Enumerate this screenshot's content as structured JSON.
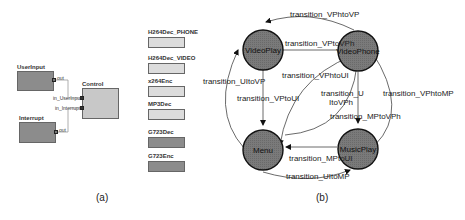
{
  "panel_a": {
    "caption": "(a)",
    "blocks": {
      "userinput": {
        "label": "UserInput",
        "port": "out"
      },
      "interrupt": {
        "label": "Interrupt",
        "port": "out"
      },
      "control": {
        "label": "Control",
        "ports": [
          "in_UserInput",
          "in_Interrupt"
        ]
      }
    },
    "component_list": [
      {
        "label": "H264Dec_PHONE",
        "shade": "light"
      },
      {
        "label": "H264Dec_VIDEO",
        "shade": "light"
      },
      {
        "label": "x264Enc",
        "shade": "light"
      },
      {
        "label": "MP3Dec",
        "shade": "light"
      },
      {
        "label": "G723Dec",
        "shade": "dark"
      },
      {
        "label": "G723Enc",
        "shade": "dark"
      }
    ]
  },
  "panel_b": {
    "caption": "(b)",
    "states": {
      "videoplay": "VideoPlay",
      "videophone": "VideoPhone",
      "menu": "Menu",
      "musicplay": "MusicPlay"
    },
    "transitions": {
      "vphtovp": "transition_VPhtoVP",
      "vptovph": "transition_VPtoVPh",
      "vphtoui": "transition_VPhtoUI",
      "uitovp": "transition_UItoVP",
      "vptoui": "transition_VPtoUI",
      "uitovph_1": "transition_U",
      "uitovph_2": "ItoVPh",
      "vphtomp": "transition_VPhtoMP",
      "mptovph": "transition_MPtoVPh",
      "mptoui": "transition_MPtoUI",
      "uitomp": "transition_UItoMP"
    },
    "colors": {
      "state_fill": "#7a7a7a",
      "edge": "#444444"
    }
  }
}
